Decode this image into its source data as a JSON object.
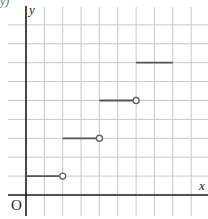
{
  "chart_data": {
    "type": "line",
    "subtype": "step-function",
    "title": "",
    "xlabel": "x",
    "ylabel": "y",
    "origin_label": "O",
    "corner_fragment": "y)",
    "grid": true,
    "xlim": [
      -1,
      10
    ],
    "ylim": [
      -1,
      10
    ],
    "segments": [
      {
        "x_start": 0,
        "x_end": 2,
        "y": 1,
        "closed_start": true,
        "open_end": true
      },
      {
        "x_start": 2,
        "x_end": 4,
        "y": 3,
        "closed_start": true,
        "open_end": true
      },
      {
        "x_start": 4,
        "x_end": 6,
        "y": 5,
        "closed_start": true,
        "open_end": true
      },
      {
        "x_start": 6,
        "x_end": 8,
        "y": 7,
        "closed_start": true,
        "open_end": false
      }
    ],
    "colors": {
      "grid": "#c8c8c8",
      "axis": "#1a1a1a",
      "segment": "#555555",
      "open_circle_fill": "#ffffff",
      "open_circle_stroke": "#666666"
    }
  }
}
